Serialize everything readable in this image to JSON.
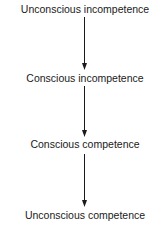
{
  "diagram": {
    "type": "vertical-flow",
    "stages": [
      {
        "label": "Unconscious incompetence"
      },
      {
        "label": "Conscious incompetence"
      },
      {
        "label": "Conscious competence"
      },
      {
        "label": "Unconscious competence"
      }
    ],
    "arrows": [
      {
        "from": 0,
        "to": 1
      },
      {
        "from": 1,
        "to": 2
      },
      {
        "from": 2,
        "to": 3
      }
    ],
    "colors": {
      "text": "#1a1a1a",
      "arrow": "#1a1a1a",
      "background": "#ffffff"
    }
  }
}
